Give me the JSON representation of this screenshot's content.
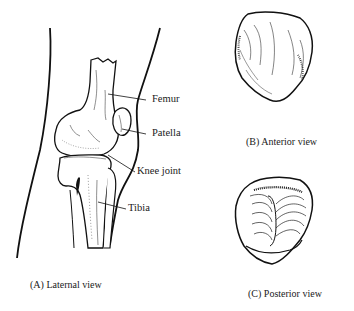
{
  "figure": {
    "labels": {
      "femur": "Femur",
      "patella": "Patella",
      "knee_joint": "Knee joint",
      "tibia": "Tibia"
    },
    "captions": {
      "a": "(A) Laternal view",
      "b": "(B) Anterior view",
      "c": "(C) Posterior view"
    }
  }
}
